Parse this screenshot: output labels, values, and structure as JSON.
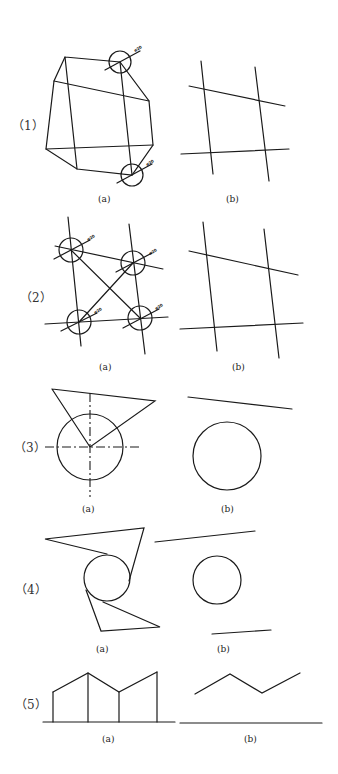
{
  "problems": [
    {
      "number": "（1）",
      "sub_a": "(a)",
      "sub_b": "(b)",
      "dimension": "ø20"
    },
    {
      "number": "（2）",
      "sub_a": "(a)",
      "sub_b": "(b)",
      "dimension": "ø20"
    },
    {
      "number": "（3）",
      "sub_a": "(a)",
      "sub_b": "(b)"
    },
    {
      "number": "（4）",
      "sub_a": "(a)",
      "sub_b": "(b)"
    },
    {
      "number": "（5）",
      "sub_a": "(a)",
      "sub_b": "(b)"
    }
  ],
  "colors": {
    "line": "#1a1a1a",
    "background": "#ffffff"
  }
}
